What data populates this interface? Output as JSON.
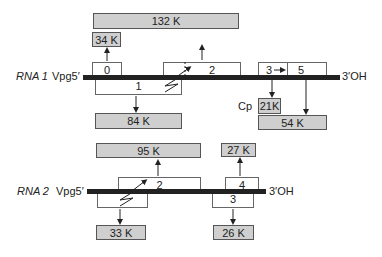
{
  "rna1": {
    "label": "RNA 1",
    "five_prime": "Vpg5′",
    "three_prime": "3′OH",
    "orfs": [
      {
        "id": "orf0",
        "label": "0",
        "strand_position": "above"
      },
      {
        "id": "orf1",
        "label": "1",
        "strand_position": "below"
      },
      {
        "id": "orf2",
        "label": "2",
        "strand_position": "above"
      },
      {
        "id": "orf3",
        "label": "3",
        "strand_position": "above"
      },
      {
        "id": "orf5",
        "label": "5",
        "strand_position": "above"
      }
    ],
    "proteins": [
      {
        "id": "p132",
        "label": "132 K"
      },
      {
        "id": "p34",
        "label": "34 K"
      },
      {
        "id": "p84",
        "label": "84 K"
      },
      {
        "id": "p21",
        "label": "21K",
        "prefix": "Cp"
      },
      {
        "id": "p54",
        "label": "54 K"
      }
    ]
  },
  "rna2": {
    "label": "RNA 2",
    "five_prime": "Vpg5′",
    "three_prime": "3′OH",
    "orfs": [
      {
        "id": "orf1",
        "label": "",
        "strand_position": "below"
      },
      {
        "id": "orf2",
        "label": "2",
        "strand_position": "above"
      },
      {
        "id": "orf3",
        "label": "3",
        "strand_position": "below"
      },
      {
        "id": "orf4",
        "label": "4",
        "strand_position": "above"
      }
    ],
    "proteins": [
      {
        "id": "p95",
        "label": "95 K"
      },
      {
        "id": "p33",
        "label": "33 K"
      },
      {
        "id": "p27",
        "label": "27 K"
      },
      {
        "id": "p26",
        "label": "26 K"
      }
    ]
  },
  "colors": {
    "protein_fill": "#cfcfcf",
    "rna_line": "#222222",
    "orf_fill": "#ffffff"
  }
}
